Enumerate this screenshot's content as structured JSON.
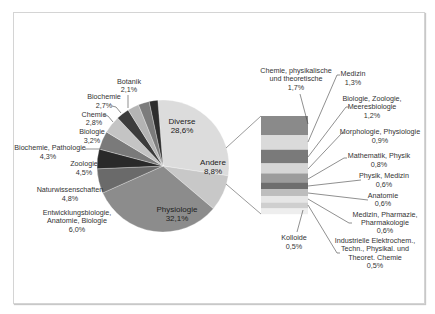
{
  "chart_data": {
    "type": "pie",
    "subtype": "pie-of-bar",
    "title": "",
    "main_pie": {
      "categories": [
        "Diverse",
        "Andere",
        "Physiologie",
        "Entwicklungsbiologie, Anatomie, Biologie",
        "Naturwissenschaften",
        "Zoologie",
        "Biochemie, Pathologie",
        "Biologie",
        "Chemie",
        "Biochemie",
        "Botanik"
      ],
      "values": [
        28.6,
        8.8,
        32.1,
        6.0,
        4.8,
        4.5,
        4.3,
        3.2,
        2.8,
        2.7,
        2.1
      ],
      "labels": [
        "28,6%",
        "8,8%",
        "32,1%",
        "6,0%",
        "4,8%",
        "4,5%",
        "4,3%",
        "3,2%",
        "2,8%",
        "2,7%",
        "2,1%"
      ],
      "colors": [
        "#dcdcdc",
        "#c8c8c8",
        "#8c8c8c",
        "#6a6a6a",
        "#2a2a2a",
        "#7a7a7a",
        "#c4c4c4",
        "#3c3c3c",
        "#b4b4b4",
        "#7c7c7c",
        "#2e2e2e"
      ]
    },
    "secondary_bar": {
      "parent": "Andere",
      "categories": [
        "Chemie, physikalische und theoretische",
        "Medizin",
        "Biologie, Zoologie, Meeresbiologie",
        "Morphologie, Physiologie",
        "Mathematik, Physik",
        "Physik, Medizin",
        "Anatomie",
        "Medizin, Pharmazie, Pharmakologie",
        "Industrielle Elektrochem., Techn., Physikal. und Theoret. Chemie",
        "Kolloide"
      ],
      "values": [
        1.7,
        1.3,
        1.2,
        0.9,
        0.8,
        0.6,
        0.6,
        0.6,
        0.5,
        0.5
      ],
      "labels": [
        "1,7%",
        "1,3%",
        "1,2%",
        "0,9%",
        "0,8%",
        "0,6%",
        "0,6%",
        "0,6%",
        "0,5%",
        "0,5%"
      ],
      "colors": [
        "#8a8a8a",
        "#dadada",
        "#7a7a7a",
        "#d6d6d6",
        "#9c9c9c",
        "#6e6e6e",
        "#bdbdbd",
        "#e6e6e6",
        "#cfcfcf",
        "#eeeeee"
      ]
    },
    "legend": "none (data labels with leader lines)"
  },
  "pie_labels": {
    "diverse": {
      "name": "Diverse",
      "pct": "28,6%"
    },
    "andere": {
      "name": "Andere",
      "pct": "8,8%"
    },
    "physiologie": {
      "name": "Physiologie",
      "pct": "32,1%"
    },
    "entwicklung": {
      "line1": "Entwicklungsbiologie,",
      "line2": "Anatomie, Biologie",
      "pct": "6,0%"
    },
    "natur": {
      "name": "Naturwissenschaften",
      "pct": "4,8%"
    },
    "zoologie": {
      "name": "Zoologie",
      "pct": "4,5%"
    },
    "biopath": {
      "name": "Biochemie, Pathologie",
      "pct": "4,3%"
    },
    "biologie": {
      "name": "Biologie",
      "pct": "3,2%"
    },
    "chemie": {
      "name": "Chemie",
      "pct": "2,8%"
    },
    "biochemie": {
      "name": "Biochemie",
      "pct": "2,7%"
    },
    "botanik": {
      "name": "Botanik",
      "pct": "2,1%"
    }
  },
  "bar_labels": {
    "chemphys": {
      "line1": "Chemie, physikalische",
      "line2": "und theoretische",
      "pct": "1,7%"
    },
    "medizin": {
      "name": "Medizin",
      "pct": "1,3%"
    },
    "biozoo": {
      "line1": "Biologie, Zoologie,",
      "line2": "Meeresbiologie",
      "pct": "1,2%"
    },
    "morph": {
      "name": "Morphologie, Physiologie",
      "pct": "0,9%"
    },
    "mathphys": {
      "name": "Mathematik, Physik",
      "pct": "0,8%"
    },
    "physmed": {
      "name": "Physik, Medizin",
      "pct": "0,6%"
    },
    "anatomie": {
      "name": "Anatomie",
      "pct": "0,6%"
    },
    "medpharm": {
      "line1": "Medizin, Pharmazie,",
      "line2": "Pharmakologie",
      "pct": "0,6%"
    },
    "indus": {
      "line1": "Industrielle Elektrochem.,",
      "line2": "Techn., Physikal. und",
      "line3": "Theoret. Chemie",
      "pct": "0,5%"
    },
    "kolloide": {
      "name": "Kolloide",
      "pct": "0,5%"
    }
  }
}
